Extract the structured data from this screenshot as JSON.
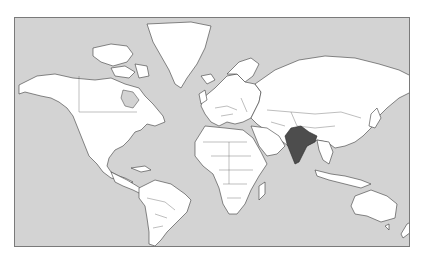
{
  "map": {
    "type": "world-political-outline",
    "projection": "mercator",
    "highlighted_country": "India",
    "colors": {
      "ocean": "#d3d3d3",
      "land": "#ffffff",
      "highlight": "#4d4d4d",
      "borders": "#3a3a3a",
      "frame": "#7a7a7a"
    },
    "labels": []
  }
}
